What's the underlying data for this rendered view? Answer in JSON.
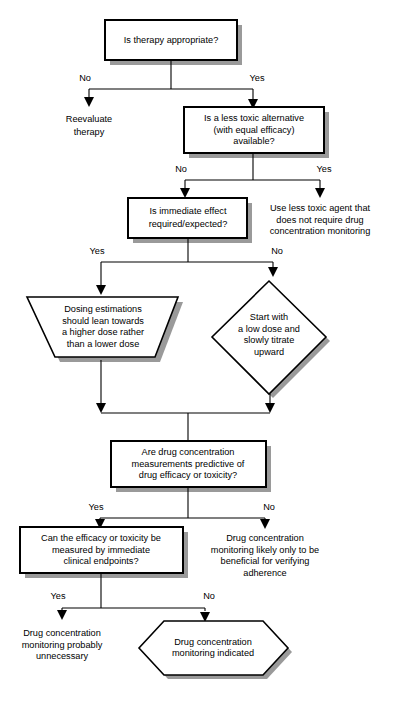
{
  "diagram": {
    "colors": {
      "stroke": "#000000",
      "fill": "#ffffff",
      "shadow": "#9a9a9a",
      "background": "#ffffff"
    },
    "nodes": {
      "q_therapy": {
        "shape": "rectangle",
        "lines": [
          "Is therapy appropriate?"
        ]
      },
      "reevaluate": {
        "shape": "text",
        "lines": [
          "Reevaluate",
          "therapy"
        ]
      },
      "q_alternative": {
        "shape": "rectangle",
        "lines": [
          "Is a less toxic alternative",
          "(with equal efficacy)",
          "available?"
        ]
      },
      "use_less_toxic": {
        "shape": "text",
        "lines": [
          "Use less toxic agent that",
          "does not require drug",
          "concentration monitoring"
        ]
      },
      "q_immediate": {
        "shape": "rectangle",
        "lines": [
          "Is immediate effect",
          "required/expected?"
        ]
      },
      "dosing_higher": {
        "shape": "trapezoid",
        "lines": [
          "Dosing estimations",
          "should lean towards",
          "a higher dose rather",
          "than a lower dose"
        ]
      },
      "start_low": {
        "shape": "diamond",
        "lines": [
          "Start with",
          "a low dose and",
          "slowly titrate",
          "upward"
        ]
      },
      "q_predictive": {
        "shape": "rectangle",
        "lines": [
          "Are drug concentration",
          "measurements predictive of",
          "drug efficacy or toxicity?"
        ]
      },
      "q_clinical_endpoints": {
        "shape": "rectangle",
        "lines": [
          "Can the efficacy or toxicity be",
          "measured by immediate",
          "clinical endpoints?"
        ]
      },
      "adherence_only": {
        "shape": "text",
        "lines": [
          "Drug concentration",
          "monitoring likely only to be",
          "beneficial for verifying",
          "adherence"
        ]
      },
      "unnecessary": {
        "shape": "text",
        "lines": [
          "Drug concentration",
          "monitoring probably",
          "unnecessary"
        ]
      },
      "indicated": {
        "shape": "hexagon",
        "lines": [
          "Drug concentration",
          "monitoring indicated"
        ]
      }
    },
    "edge_labels": {
      "therapy_no": "No",
      "therapy_yes": "Yes",
      "alternative_no": "No",
      "alternative_yes": "Yes",
      "immediate_yes": "Yes",
      "immediate_no": "No",
      "predictive_yes": "Yes",
      "predictive_no": "No",
      "endpoints_yes": "Yes",
      "endpoints_no": "No"
    }
  }
}
